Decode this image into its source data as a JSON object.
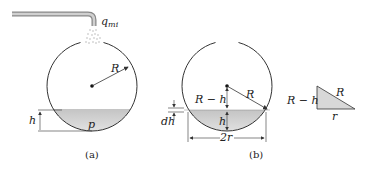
{
  "figure_a": {
    "caption": "(a)",
    "flow_label": "q",
    "flow_subscript": "mi",
    "radius_label": "R",
    "height_label": "h",
    "pressure_label": "p"
  },
  "figure_b": {
    "caption": "(b)",
    "r_minus_h_label": "R − h",
    "radius_label": "R",
    "height_label": "h",
    "dh_label": "dh",
    "width_label": "2r"
  },
  "triangle": {
    "vertical_label": "R − h",
    "hypotenuse_label": "R",
    "base_label": "r"
  },
  "colors": {
    "stroke": "#333333",
    "liquid_top": "#c8c8c8",
    "liquid_bottom": "#e6e6e6",
    "pipe": "#9a9a9a"
  }
}
